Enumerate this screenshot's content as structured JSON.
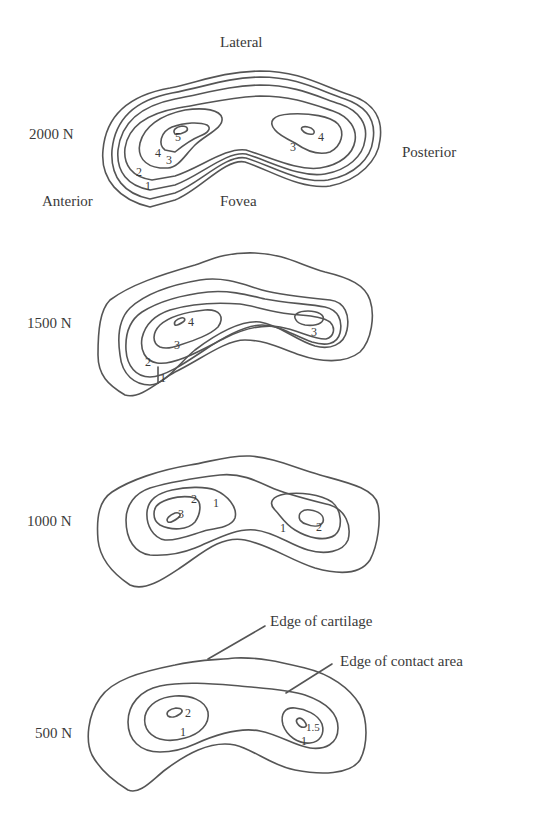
{
  "figure": {
    "orientation_labels": {
      "top": "Lateral",
      "left": "Anterior",
      "right": "Posterior",
      "bottom": "Fovea"
    },
    "panels": [
      {
        "load_label": "2000 N",
        "contour_labels": [
          "5",
          "4",
          "3",
          "2",
          "1",
          "4",
          "3"
        ]
      },
      {
        "load_label": "1500 N",
        "contour_labels": [
          "4",
          "3",
          "2",
          "1",
          "3"
        ]
      },
      {
        "load_label": "1000 N",
        "contour_labels": [
          "2",
          "1",
          "3",
          "1",
          "2"
        ]
      },
      {
        "load_label": "500 N",
        "contour_labels": [
          "2",
          "1",
          "1.5",
          "1"
        ],
        "annotations": {
          "cartilage_edge": "Edge of cartilage",
          "contact_edge": "Edge of contact area"
        }
      }
    ]
  }
}
